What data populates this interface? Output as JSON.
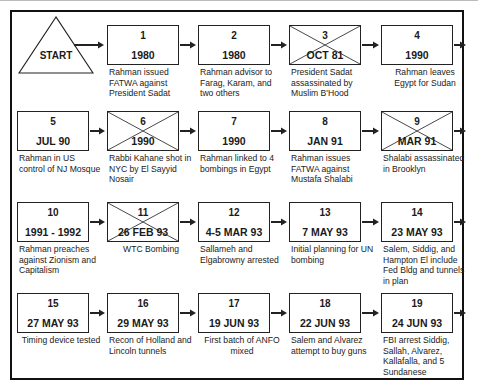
{
  "start": {
    "label": "START"
  },
  "events": [
    {
      "num": "1",
      "date": "1980",
      "desc": "Rahman issued FATWA against President Sadat",
      "crossed": false
    },
    {
      "num": "2",
      "date": "1980",
      "desc": "Rahman advisor to Farag, Karam, and two others",
      "crossed": false
    },
    {
      "num": "3",
      "date": "OCT 81",
      "desc": "President Sadat assassinated by Muslim B'Hood",
      "crossed": true
    },
    {
      "num": "4",
      "date": "1990",
      "desc": "Rahman leaves Egypt for Sudan",
      "crossed": false
    },
    {
      "num": "5",
      "date": "JUL 90",
      "desc": "Rahman in US control of NJ Mosque",
      "crossed": false
    },
    {
      "num": "6",
      "date": "1990",
      "desc": "Rabbi Kahane shot in NYC by El Sayyid Nosair",
      "crossed": true
    },
    {
      "num": "7",
      "date": "1990",
      "desc": "Rahman linked to 4 bombings in Egypt",
      "crossed": false
    },
    {
      "num": "8",
      "date": "JAN 91",
      "desc": "Rahman issues FATWA against Mustafa Shalabi",
      "crossed": false
    },
    {
      "num": "9",
      "date": "MAR 91",
      "desc": "Shalabi assassinated in Brooklyn",
      "crossed": true
    },
    {
      "num": "10",
      "date": "1991 - 1992",
      "desc": "Rahman preaches against Zionism and Capitalism",
      "crossed": false
    },
    {
      "num": "11",
      "date": "26 FEB 93",
      "desc": "WTC Bombing",
      "crossed": true
    },
    {
      "num": "12",
      "date": "4-5 MAR 93",
      "desc": "Sallameh and Elgabrowny arrested",
      "crossed": false
    },
    {
      "num": "13",
      "date": "7 MAY 93",
      "desc": "Initial planning for UN bombing",
      "crossed": false
    },
    {
      "num": "14",
      "date": "23 MAY 93",
      "desc": "Salem, Siddig, and Hampton El include Fed Bldg and tunnels in plan",
      "crossed": false
    },
    {
      "num": "15",
      "date": "27 MAY 93",
      "desc": "Timing device tested",
      "crossed": false
    },
    {
      "num": "16",
      "date": "29 MAY 93",
      "desc": "Recon of Holland and Lincoln tunnels",
      "crossed": false
    },
    {
      "num": "17",
      "date": "19 JUN 93",
      "desc": "First batch of ANFO mixed",
      "crossed": false
    },
    {
      "num": "18",
      "date": "22 JUN 93",
      "desc": "Salem and Alvarez attempt to buy guns",
      "crossed": false
    },
    {
      "num": "19",
      "date": "24 JUN 93",
      "desc": "FBI arrest Siddig, Sallah, Alvarez, Kallafalla, and 5 Sundanese",
      "crossed": false
    }
  ],
  "colors": {
    "line": "#222222",
    "background": "#ffffff"
  }
}
